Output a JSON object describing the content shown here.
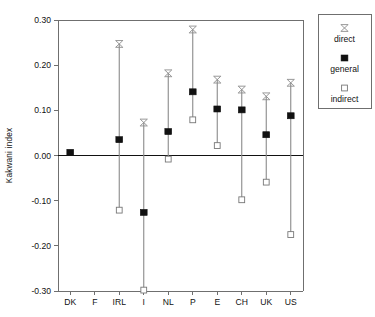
{
  "chart_data": {
    "type": "scatter",
    "title": "",
    "xlabel": "",
    "ylabel": "Kakwani index",
    "ylim": [
      -0.3,
      0.3
    ],
    "ytick_labels": [
      "0.30",
      "0.20",
      "0.10",
      "0.00",
      "-0.10",
      "-0.20",
      "-0.30"
    ],
    "ytick_values": [
      0.3,
      0.2,
      0.1,
      0.0,
      -0.1,
      -0.2,
      -0.3
    ],
    "grid": false,
    "legend_position": "right-top",
    "categories": [
      "DK",
      "F",
      "IRL",
      "I",
      "NL",
      "P",
      "E",
      "CH",
      "UK",
      "US"
    ],
    "series": [
      {
        "name": "direct",
        "marker": "x-bar",
        "values": [
          null,
          null,
          0.247,
          0.073,
          0.182,
          0.279,
          0.168,
          0.146,
          0.131,
          0.161
        ]
      },
      {
        "name": "general",
        "marker": "filled-square",
        "values": [
          0.007,
          null,
          0.035,
          -0.126,
          0.053,
          0.141,
          0.103,
          0.101,
          0.046,
          0.088
        ]
      },
      {
        "name": "indirect",
        "marker": "open-square",
        "values": [
          null,
          null,
          -0.121,
          -0.298,
          -0.008,
          0.079,
          0.022,
          -0.098,
          -0.059,
          -0.175
        ]
      }
    ]
  },
  "legend": {
    "entries": [
      {
        "label": "direct"
      },
      {
        "label": "general"
      },
      {
        "label": "indirect"
      }
    ]
  },
  "colors": {
    "marker_general": "#111111",
    "marker_indirect_fill": "#ffffff",
    "marker_indirect_stroke": "#777777",
    "marker_direct": "#8d8d8d",
    "stem": "#8a8a8a",
    "axis": "#6f6f6f",
    "zero_line": "#111111",
    "background": "#ffffff"
  }
}
